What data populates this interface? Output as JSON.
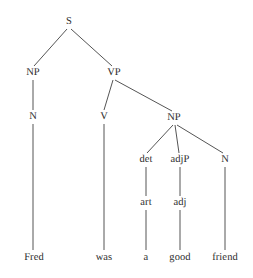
{
  "figure": {
    "type": "constituency-syntax-tree",
    "sentence": "Fred was a good friend",
    "background_color": "#ffffff",
    "line_color": "#555555",
    "text_color": "#2b2b2b"
  },
  "nodes": [
    {
      "id": "S",
      "label": "S",
      "x": 69,
      "y": 22,
      "kind": "nonterminal"
    },
    {
      "id": "NP1",
      "label": "NP",
      "x": 33,
      "y": 73,
      "kind": "nonterminal"
    },
    {
      "id": "VP",
      "label": "VP",
      "x": 114,
      "y": 73,
      "kind": "nonterminal"
    },
    {
      "id": "N1",
      "label": "N",
      "x": 33,
      "y": 117,
      "kind": "nonterminal"
    },
    {
      "id": "V",
      "label": "V",
      "x": 104,
      "y": 117,
      "kind": "nonterminal"
    },
    {
      "id": "NP2",
      "label": "NP",
      "x": 174,
      "y": 118,
      "kind": "nonterminal"
    },
    {
      "id": "det",
      "label": "det",
      "x": 146,
      "y": 160,
      "kind": "nonterminal"
    },
    {
      "id": "adjP",
      "label": "adjP",
      "x": 180,
      "y": 160,
      "kind": "nonterminal"
    },
    {
      "id": "N2",
      "label": "N",
      "x": 225,
      "y": 160,
      "kind": "nonterminal"
    },
    {
      "id": "art",
      "label": "art",
      "x": 146,
      "y": 203,
      "kind": "nonterminal"
    },
    {
      "id": "adj",
      "label": "adj",
      "x": 180,
      "y": 203,
      "kind": "nonterminal"
    },
    {
      "id": "w_fred",
      "label": "Fred",
      "x": 34,
      "y": 258,
      "kind": "terminal"
    },
    {
      "id": "w_was",
      "label": "was",
      "x": 104,
      "y": 258,
      "kind": "terminal"
    },
    {
      "id": "w_a",
      "label": "a",
      "x": 146,
      "y": 258,
      "kind": "terminal"
    },
    {
      "id": "w_good",
      "label": "good",
      "x": 180,
      "y": 258,
      "kind": "terminal"
    },
    {
      "id": "w_friend",
      "label": "friend",
      "x": 225,
      "y": 258,
      "kind": "terminal"
    }
  ],
  "edges": [
    {
      "from": "S",
      "to": "NP1",
      "x1": 67,
      "y1": 29,
      "x2": 34,
      "y2": 66
    },
    {
      "from": "S",
      "to": "VP",
      "x1": 71,
      "y1": 29,
      "x2": 112,
      "y2": 66
    },
    {
      "from": "NP1",
      "to": "N1",
      "x1": 33,
      "y1": 80,
      "x2": 33,
      "y2": 110
    },
    {
      "from": "N1",
      "to": "w_fred",
      "x1": 33,
      "y1": 124,
      "x2": 33,
      "y2": 250
    },
    {
      "from": "VP",
      "to": "V",
      "x1": 113,
      "y1": 80,
      "x2": 104,
      "y2": 110
    },
    {
      "from": "VP",
      "to": "NP2",
      "x1": 115,
      "y1": 80,
      "x2": 172,
      "y2": 111
    },
    {
      "from": "V",
      "to": "w_was",
      "x1": 104,
      "y1": 124,
      "x2": 104,
      "y2": 250
    },
    {
      "from": "NP2",
      "to": "det",
      "x1": 173,
      "y1": 125,
      "x2": 147,
      "y2": 153
    },
    {
      "from": "NP2",
      "to": "adjP",
      "x1": 175,
      "y1": 125,
      "x2": 179,
      "y2": 153
    },
    {
      "from": "NP2",
      "to": "N2",
      "x1": 177,
      "y1": 125,
      "x2": 223,
      "y2": 153
    },
    {
      "from": "det",
      "to": "art",
      "x1": 146,
      "y1": 167,
      "x2": 146,
      "y2": 196
    },
    {
      "from": "adjP",
      "to": "adj",
      "x1": 180,
      "y1": 167,
      "x2": 180,
      "y2": 196
    },
    {
      "from": "N2",
      "to": "w_friend",
      "x1": 225,
      "y1": 167,
      "x2": 225,
      "y2": 250
    },
    {
      "from": "art",
      "to": "w_a",
      "x1": 146,
      "y1": 210,
      "x2": 146,
      "y2": 250
    },
    {
      "from": "adj",
      "to": "w_good",
      "x1": 180,
      "y1": 210,
      "x2": 180,
      "y2": 250
    }
  ],
  "chart_data": {
    "type": "diagram",
    "title": "",
    "structure": "(S (NP (N Fred)) (VP (V was) (NP (det (art a)) (adjP (adj good)) (N friend))))",
    "terminals": [
      "Fred",
      "was",
      "a",
      "good",
      "friend"
    ],
    "nonterminals": [
      "S",
      "NP",
      "VP",
      "N",
      "V",
      "NP",
      "det",
      "adjP",
      "N",
      "art",
      "adj"
    ]
  }
}
